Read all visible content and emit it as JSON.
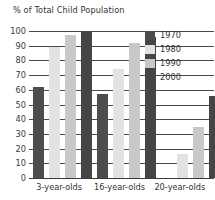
{
  "chart_data": {
    "type": "bar",
    "title": "% of Total Child Population",
    "xlabel": "",
    "ylabel": "",
    "ylim": [
      0,
      100
    ],
    "yticks": [
      0,
      10,
      20,
      30,
      40,
      50,
      60,
      70,
      80,
      90,
      100
    ],
    "grid": true,
    "legend_position": "top-right",
    "categories": [
      "3-year-olds",
      "16-year-olds",
      "20-year-olds"
    ],
    "series": [
      {
        "name": "1970",
        "color": "#4d4d4d",
        "values": [
          62,
          57,
          0
        ]
      },
      {
        "name": "1980",
        "color": "#e2e2e2",
        "values": [
          89,
          74,
          16
        ]
      },
      {
        "name": "1990",
        "color": "#c8c8c8",
        "values": [
          97,
          92,
          35
        ]
      },
      {
        "name": "2000",
        "color": "#454545",
        "values": [
          99,
          96,
          56
        ]
      }
    ]
  },
  "legend": {
    "items": [
      {
        "label": "1970",
        "color": "#4d4d4d"
      },
      {
        "label": "1980",
        "color": "#e2e2e2"
      },
      {
        "label": "1990",
        "color": "#c8c8c8"
      },
      {
        "label": "2000",
        "color": "#454545"
      }
    ]
  },
  "axis": {
    "y_tick_labels": [
      "100",
      "90",
      "80",
      "70",
      "60",
      "50",
      "40",
      "30",
      "20",
      "10",
      "0"
    ]
  }
}
